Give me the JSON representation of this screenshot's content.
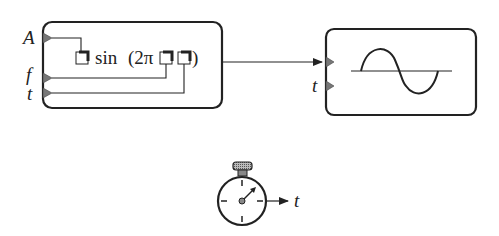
{
  "generator_block": {
    "inputs": [
      {
        "label": "A",
        "name": "amplitude"
      },
      {
        "label": "f",
        "name": "frequency"
      },
      {
        "label": "t",
        "name": "time"
      }
    ],
    "formula": {
      "prefix": "sin",
      "open": "(2π",
      "close": ")"
    }
  },
  "display_block": {
    "inputs": [
      {
        "label": "",
        "name": "signal"
      },
      {
        "label": "t",
        "name": "time"
      }
    ],
    "icon": "sine-wave-icon"
  },
  "clock": {
    "icon": "stopwatch-icon",
    "output_label": "t"
  },
  "colors": {
    "stroke": "#222222",
    "port_fill": "#777777",
    "crown_fill": "#9a9a9a"
  }
}
